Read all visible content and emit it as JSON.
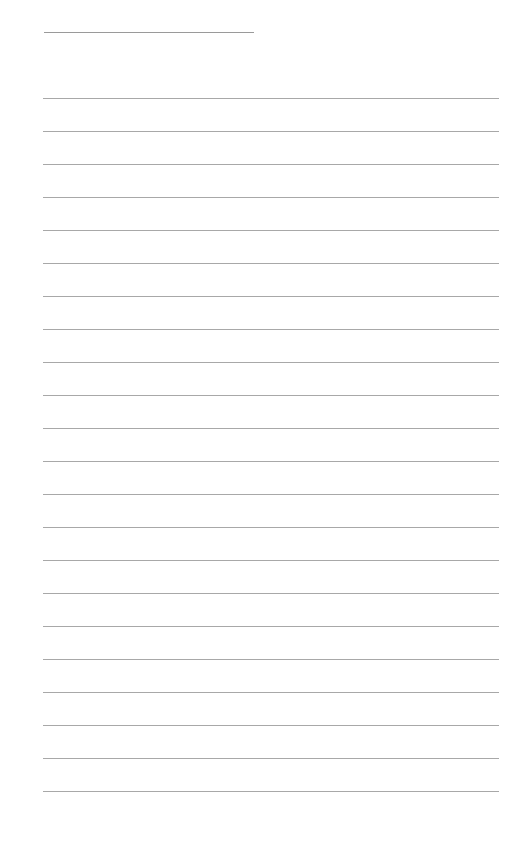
{
  "page": {
    "type": "lined-paper",
    "background": "#ffffff",
    "line_color": "#a8a8a8",
    "header_line": {
      "x": 44,
      "y": 32,
      "width": 210
    },
    "ruled_lines": {
      "count": 22,
      "start_y": 98,
      "spacing": 33,
      "x": 43,
      "width": 456
    }
  }
}
